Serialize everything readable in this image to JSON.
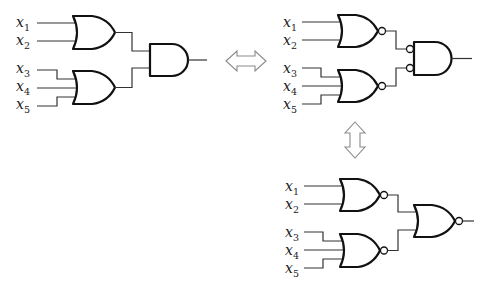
{
  "figure": {
    "colors": {
      "gate_stroke": "#111111",
      "wire": "#333333",
      "arrow": "#8a8a8a",
      "background": "#ffffff"
    },
    "arrows": [
      {
        "name": "horizontal-double-arrow",
        "orientation": "horizontal",
        "meaning": "equivalent"
      },
      {
        "name": "vertical-double-arrow",
        "orientation": "vertical",
        "meaning": "equivalent"
      }
    ],
    "circuits": [
      {
        "id": "or-and",
        "inputs": [
          {
            "var": "x",
            "sub": "1"
          },
          {
            "var": "x",
            "sub": "2"
          },
          {
            "var": "x",
            "sub": "3"
          },
          {
            "var": "x",
            "sub": "4"
          },
          {
            "var": "x",
            "sub": "5"
          }
        ],
        "first_level": [
          {
            "type": "OR",
            "inputs": [
              "x1",
              "x2"
            ]
          },
          {
            "type": "OR",
            "inputs": [
              "x3",
              "x4",
              "x5"
            ]
          }
        ],
        "second_level": {
          "type": "AND",
          "inverted_inputs": false
        }
      },
      {
        "id": "nor-and-inverted-inputs",
        "inputs": [
          {
            "var": "x",
            "sub": "1"
          },
          {
            "var": "x",
            "sub": "2"
          },
          {
            "var": "x",
            "sub": "3"
          },
          {
            "var": "x",
            "sub": "4"
          },
          {
            "var": "x",
            "sub": "5"
          }
        ],
        "first_level": [
          {
            "type": "NOR",
            "inputs": [
              "x1",
              "x2"
            ]
          },
          {
            "type": "NOR",
            "inputs": [
              "x3",
              "x4",
              "x5"
            ]
          }
        ],
        "second_level": {
          "type": "AND",
          "inverted_inputs": true
        }
      },
      {
        "id": "nor-nor",
        "inputs": [
          {
            "var": "x",
            "sub": "1"
          },
          {
            "var": "x",
            "sub": "2"
          },
          {
            "var": "x",
            "sub": "3"
          },
          {
            "var": "x",
            "sub": "4"
          },
          {
            "var": "x",
            "sub": "5"
          }
        ],
        "first_level": [
          {
            "type": "NOR",
            "inputs": [
              "x1",
              "x2"
            ]
          },
          {
            "type": "NOR",
            "inputs": [
              "x3",
              "x4",
              "x5"
            ]
          }
        ],
        "second_level": {
          "type": "NOR",
          "inverted_inputs": false
        }
      }
    ]
  }
}
